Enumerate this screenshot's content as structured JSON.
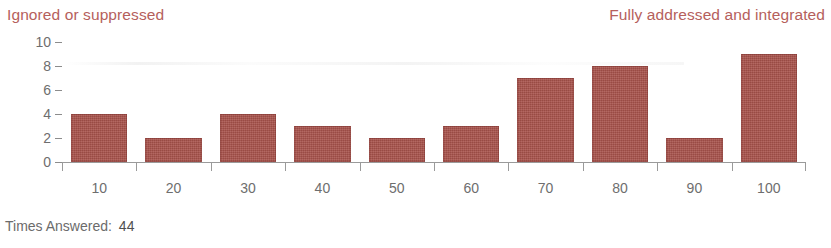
{
  "scale": {
    "left_label": "Ignored or suppressed",
    "right_label": "Fully addressed and integrated",
    "label_color": "#b5605c"
  },
  "footer": {
    "label": "Times Answered:",
    "value": "44"
  },
  "chart_data": {
    "type": "bar",
    "title": "",
    "subtitle": "",
    "xlabel": "",
    "ylabel": "",
    "categories": [
      "10",
      "20",
      "30",
      "40",
      "50",
      "60",
      "70",
      "80",
      "90",
      "100"
    ],
    "values": [
      4,
      2,
      4,
      3,
      2,
      3,
      7,
      8,
      2,
      9
    ],
    "ylim": [
      0,
      10
    ],
    "ytick_labels": [
      "0",
      "2",
      "4",
      "6",
      "8",
      "10"
    ],
    "ytick_values": [
      0,
      2,
      4,
      6,
      8,
      10
    ],
    "xlim_labels": [
      "10",
      "100"
    ],
    "grid": false,
    "legend": "none",
    "bar_color": "#a8524b",
    "axis_color": "#9a9a9a",
    "tick_label_color": "#6e6e6e",
    "total_responses": 44
  }
}
